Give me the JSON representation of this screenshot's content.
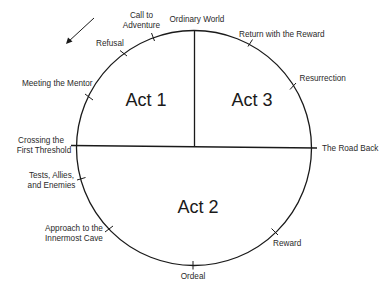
{
  "diagram": {
    "colors": {
      "line": "#1a1a1a",
      "text": "#2a2a2a",
      "background": "#ffffff"
    },
    "direction_arrow": {
      "icon": "arrow-down-left-icon",
      "meaning": "counter-clockwise direction"
    },
    "acts": [
      {
        "id": "act1",
        "label": "Act 1"
      },
      {
        "id": "act2",
        "label": "Act 2"
      },
      {
        "id": "act3",
        "label": "Act 3"
      }
    ],
    "stages": {
      "ordinary_world": {
        "lines": [
          "Ordinary World"
        ]
      },
      "call_to_adventure": {
        "lines": [
          "Call to",
          "Adventure"
        ]
      },
      "refusal": {
        "lines": [
          "Refusal"
        ]
      },
      "meeting_the_mentor": {
        "lines": [
          "Meeting the Mentor"
        ]
      },
      "crossing_the_first_threshold": {
        "lines": [
          "Crossing the",
          "First Threshold"
        ]
      },
      "tests_allies_enemies": {
        "lines": [
          "Tests, Allies,",
          "and Enemies"
        ]
      },
      "approach_innermost_cave": {
        "lines": [
          "Approach to the",
          "Innermost Cave"
        ]
      },
      "ordeal": {
        "lines": [
          "Ordeal"
        ]
      },
      "reward": {
        "lines": [
          "Reward"
        ]
      },
      "the_road_back": {
        "lines": [
          "The Road Back"
        ]
      },
      "resurrection": {
        "lines": [
          "Resurrection"
        ]
      },
      "return_with_the_reward": {
        "lines": [
          "Return with the Reward"
        ]
      }
    }
  }
}
